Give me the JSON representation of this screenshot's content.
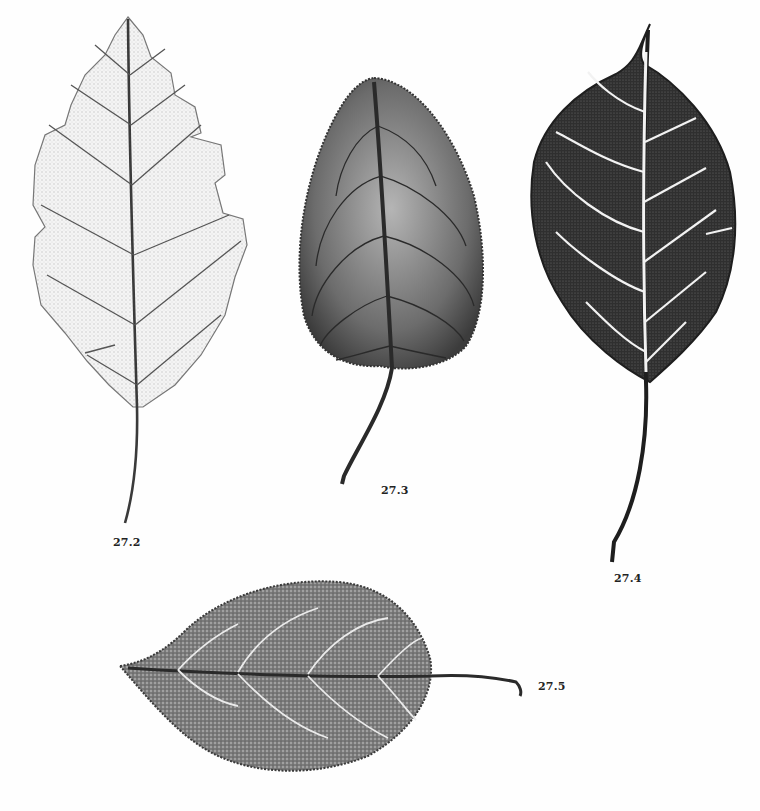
{
  "plate": {
    "background": "#fefefe",
    "figures": [
      {
        "id": "27.2",
        "label": "27.2",
        "description": "Lobed leaf print, pale tone",
        "tone": "#c9c9c9",
        "vein": "#555555"
      },
      {
        "id": "27.3",
        "label": "27.3",
        "description": "Ovate serrated leaf print, medium-dark tone",
        "tone": "#6a6a6a",
        "vein": "#2a2a2a"
      },
      {
        "id": "27.4",
        "label": "27.4",
        "description": "Ovate acuminate leaf print, very dark tone with white veins",
        "tone": "#2e2e2e",
        "vein": "#f2f2f2"
      },
      {
        "id": "27.5",
        "label": "27.5",
        "description": "Horizontal elliptic serrated leaf print with long petiole",
        "tone": "#7a7a7a",
        "vein": "#e8e8e8"
      }
    ]
  }
}
